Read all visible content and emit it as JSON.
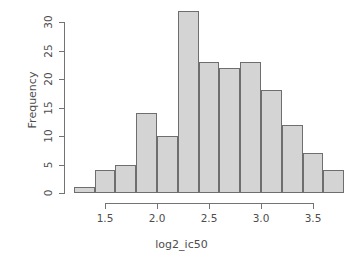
{
  "chart_data": {
    "type": "bar",
    "title": "",
    "subtitle": "",
    "xlabel": "log2_ic50",
    "ylabel": "Frequency",
    "grid": false,
    "legend": false,
    "legend_position": "none",
    "bin_width": 0.2,
    "bin_edges": [
      1.2,
      1.4,
      1.6,
      1.8,
      2.0,
      2.2,
      2.4,
      2.6,
      2.8,
      3.0,
      3.2,
      3.4,
      3.6,
      3.8
    ],
    "categories": [
      "1.2-1.4",
      "1.4-1.6",
      "1.6-1.8",
      "1.8-2.0",
      "2.0-2.2",
      "2.2-2.4",
      "2.4-2.6",
      "2.6-2.8",
      "2.8-3.0",
      "3.0-3.2",
      "3.2-3.4",
      "3.4-3.6",
      "3.6-3.8"
    ],
    "values": [
      1,
      4,
      5,
      14,
      10,
      32,
      23,
      22,
      23,
      18,
      12,
      7,
      4
    ],
    "xlim": [
      1.2,
      3.8
    ],
    "ylim": [
      0,
      32
    ],
    "x_ticks": [
      1.5,
      2.0,
      2.5,
      3.0,
      3.5
    ],
    "x_tick_labels": [
      "1.5",
      "2.0",
      "2.5",
      "3.0",
      "3.5"
    ],
    "y_ticks": [
      0,
      5,
      10,
      15,
      20,
      25,
      30
    ],
    "y_tick_labels": [
      "0",
      "5",
      "10",
      "15",
      "20",
      "25",
      "30"
    ],
    "bar_fill_color": "#d4d4d4",
    "bar_border_color": "#6e6e6e",
    "axis_color": "#737373",
    "text_color": "#4d4d4d",
    "background_color": "#ffffff"
  },
  "axes": {
    "y_label": "Frequency",
    "x_label": "log2_ic50"
  }
}
